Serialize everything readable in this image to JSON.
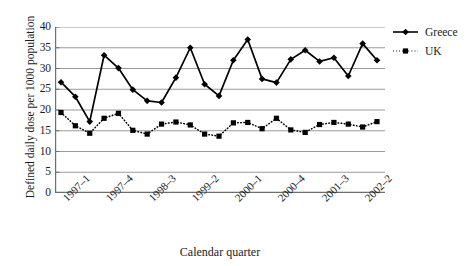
{
  "chart_data": {
    "type": "line",
    "title": "",
    "xlabel": "Calendar quarter",
    "ylabel": "Defined daily dose per 1000 population",
    "ylim": [
      0,
      40
    ],
    "ytick_values": [
      0,
      5,
      10,
      15,
      20,
      25,
      30,
      35,
      40
    ],
    "ytick_labels": [
      "0",
      "5",
      "10",
      "15",
      "20",
      "25",
      "30",
      "35",
      "40"
    ],
    "grid": "horizontal",
    "legend_position": "right",
    "x": [
      "1997-1",
      "1997-2",
      "1997-3",
      "1997-4",
      "1998-1",
      "1998-2",
      "1998-3",
      "1998-4",
      "1999-1",
      "1999-2",
      "1999-3",
      "1999-4",
      "2000-1",
      "2000-2",
      "2000-3",
      "2000-4",
      "2001-1",
      "2001-2",
      "2001-3",
      "2001-4",
      "2002-1",
      "2002-2",
      "2002-3"
    ],
    "xtick_labels": [
      "1997–1",
      "",
      "",
      "1997–4",
      "",
      "",
      "1998–3",
      "",
      "",
      "1999–2",
      "",
      "",
      "2000–1",
      "",
      "",
      "2000–4",
      "",
      "",
      "2001–3",
      "",
      "",
      "2002–2",
      ""
    ],
    "xtick_labels_shown": [
      "1997–1",
      "1997–4",
      "1998–3",
      "1999–2",
      "2000–1",
      "2000–4",
      "2001–3",
      "2002–2"
    ],
    "xtick_label_indices": [
      0,
      3,
      6,
      9,
      12,
      15,
      18,
      21
    ],
    "series": [
      {
        "name": "Greece",
        "marker": "diamond",
        "linestyle": "solid",
        "color": "#000000",
        "values": [
          26.7,
          23.2,
          17.2,
          33.2,
          30.1,
          24.9,
          22.2,
          21.8,
          27.8,
          35.0,
          26.2,
          23.4,
          32.0,
          37.0,
          27.5,
          26.6,
          32.2,
          34.4,
          31.7,
          32.6,
          28.2,
          36.0,
          32.0
        ]
      },
      {
        "name": "UK",
        "marker": "square",
        "linestyle": "dotted",
        "color": "#000000",
        "values": [
          19.4,
          16.2,
          14.4,
          18.0,
          19.2,
          15.1,
          14.2,
          16.6,
          17.1,
          16.4,
          14.2,
          13.7,
          16.9,
          17.0,
          15.5,
          18.0,
          15.2,
          14.6,
          16.5,
          17.0,
          16.6,
          15.9,
          17.2
        ]
      }
    ]
  },
  "legend": {
    "items": [
      {
        "label": "Greece",
        "marker": "diamond",
        "linestyle": "solid"
      },
      {
        "label": "UK",
        "marker": "square",
        "linestyle": "dotted"
      }
    ]
  },
  "axes": {
    "x_title": "Calendar quarter",
    "y_title": "Defined daily dose per 1000 population"
  }
}
